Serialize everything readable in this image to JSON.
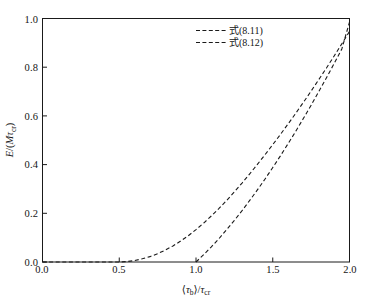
{
  "chart_data": {
    "type": "line",
    "title": "",
    "xlabel": "⟨τb⟩/τcr",
    "ylabel": "E/(Mτcr)",
    "xlim": [
      0.0,
      2.0
    ],
    "ylim": [
      0.0,
      1.0
    ],
    "grid": false,
    "legend_position": "top-center",
    "xticks": [
      "0.0",
      "0.5",
      "1.0",
      "1.5",
      "2.0"
    ],
    "xtick_values": [
      0.0,
      0.5,
      1.0,
      1.5,
      2.0
    ],
    "yticks": [
      "0.0",
      "0.2",
      "0.4",
      "0.6",
      "0.8",
      "1.0"
    ],
    "ytick_values": [
      0.0,
      0.2,
      0.4,
      0.6,
      0.8,
      1.0
    ],
    "series": [
      {
        "name": "式(8.11)",
        "style": "dashed",
        "color": "#1a1a1a",
        "x": [
          0.0,
          0.1,
          0.2,
          0.3,
          0.4,
          0.5,
          0.55,
          0.6,
          0.65,
          0.7,
          0.75,
          0.8,
          0.85,
          0.9,
          0.95,
          1.0,
          1.05,
          1.1,
          1.15,
          1.2,
          1.25,
          1.3,
          1.35,
          1.4,
          1.45,
          1.5,
          1.55,
          1.6,
          1.65,
          1.7,
          1.75,
          1.8,
          1.85,
          1.9,
          1.95,
          2.0
        ],
        "y": [
          0.0,
          0.0,
          0.0,
          0.0,
          0.0,
          0.0,
          0.002,
          0.006,
          0.013,
          0.022,
          0.034,
          0.049,
          0.066,
          0.086,
          0.108,
          0.133,
          0.16,
          0.189,
          0.22,
          0.253,
          0.288,
          0.324,
          0.362,
          0.401,
          0.441,
          0.482,
          0.524,
          0.567,
          0.611,
          0.656,
          0.702,
          0.749,
          0.797,
          0.846,
          0.896,
          0.947
        ]
      },
      {
        "name": "式(8.12)",
        "style": "dashed",
        "color": "#1a1a1a",
        "x": [
          1.0,
          1.05,
          1.1,
          1.15,
          1.2,
          1.25,
          1.3,
          1.35,
          1.4,
          1.45,
          1.5,
          1.55,
          1.6,
          1.65,
          1.7,
          1.75,
          1.8,
          1.85,
          1.9,
          1.95,
          2.0
        ],
        "y": [
          0.0,
          0.03,
          0.062,
          0.096,
          0.133,
          0.171,
          0.211,
          0.253,
          0.296,
          0.341,
          0.388,
          0.436,
          0.486,
          0.537,
          0.59,
          0.644,
          0.7,
          0.757,
          0.815,
          0.875,
          0.985
        ]
      }
    ]
  },
  "legend": {
    "items": [
      {
        "label": "式(8.11)"
      },
      {
        "label": "式(8.12)"
      }
    ]
  },
  "axes": {
    "x_title_parts": {
      "open": "⟨",
      "tau": "τ",
      "sub_b": "b",
      "close": "⟩",
      "slash": "/",
      "tau2": "τ",
      "sub_cr": "cr"
    },
    "y_title_parts": {
      "e": "E",
      "slash_open": "/(",
      "m": "M",
      "tau": "τ",
      "sub_cr": "cr",
      "close": ")"
    }
  },
  "colors": {
    "background": "#ffffff",
    "axis": "#1a1a1a",
    "curve": "#1a1a1a",
    "text": "#141414"
  }
}
